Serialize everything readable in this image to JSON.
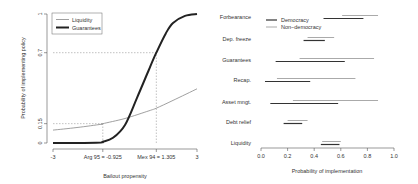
{
  "chart_data": [
    {
      "type": "line",
      "panel": "left",
      "title": "",
      "xlabel": "Bailout propensity",
      "ylabel": "Probability of implementing policy",
      "xlim": [
        -3,
        3
      ],
      "ylim": [
        0,
        1
      ],
      "x_ticks": [
        -3,
        -0.925,
        1.305,
        3
      ],
      "x_tick_labels": [
        "-3",
        "Arg 95 = -0.925",
        "Mex 94 = 1.305",
        "3"
      ],
      "y_ticks": [
        0,
        0.15,
        0.7,
        1
      ],
      "y_tick_labels": [
        "0",
        "0.15",
        "0.7",
        "1"
      ],
      "grid": false,
      "legend": {
        "position": "top-left",
        "entries": [
          {
            "label": "Liquidity",
            "color": "#888888",
            "width": 0.8
          },
          {
            "label": "Guarantees",
            "color": "#222222",
            "width": 2
          }
        ]
      },
      "series": [
        {
          "name": "Liquidity",
          "x": [
            -3,
            -2,
            -1,
            -0.925,
            0,
            1,
            1.305,
            2,
            3
          ],
          "y": [
            0.1,
            0.12,
            0.145,
            0.15,
            0.19,
            0.25,
            0.27,
            0.33,
            0.42
          ]
        },
        {
          "name": "Guarantees",
          "x": [
            -3,
            -2,
            -1,
            -0.925,
            -0.5,
            0,
            0.5,
            1,
            1.305,
            1.7,
            2,
            2.5,
            3
          ],
          "y": [
            0.0,
            0.0,
            0.005,
            0.01,
            0.04,
            0.14,
            0.35,
            0.57,
            0.7,
            0.85,
            0.93,
            0.985,
            1.0
          ]
        }
      ],
      "annotations": [
        {
          "type": "dashed-vline",
          "x": -0.925,
          "y_to": 0.15,
          "label": "Arg 95 = -0.925"
        },
        {
          "type": "dashed-hline",
          "y": 0.15,
          "x_to": -0.925
        },
        {
          "type": "dashed-vline",
          "x": 1.305,
          "y_to": 0.7,
          "label": "Mex 94 = 1.305"
        },
        {
          "type": "dashed-hline",
          "y": 0.7,
          "x_to": 1.305
        }
      ]
    },
    {
      "type": "interval",
      "panel": "right",
      "title": "",
      "xlabel": "Probability of implementation",
      "ylabel": "",
      "xlim": [
        0,
        1
      ],
      "x_ticks": [
        0.0,
        0.2,
        0.4,
        0.6,
        0.8,
        1.0
      ],
      "x_tick_labels": [
        "0.0",
        "0.2",
        "0.4",
        "0.6",
        "0.8",
        "1.0"
      ],
      "grid": false,
      "legend": {
        "position": "top-left",
        "entries": [
          {
            "label": "Democracy",
            "color": "#333333"
          },
          {
            "label": "Non−democracy",
            "color": "#aaaaaa"
          }
        ]
      },
      "categories": [
        "Forbearance",
        "Dep. freeze",
        "Guarantees",
        "Recap.",
        "Asset mngt.",
        "Debt relief",
        "Liquidity"
      ],
      "series": [
        {
          "name": "Democracy",
          "intervals": [
            [
              0.47,
              0.77
            ],
            [
              0.32,
              0.48
            ],
            [
              0.11,
              0.63
            ],
            [
              0.03,
              0.37
            ],
            [
              0.07,
              0.58
            ],
            [
              0.17,
              0.31
            ],
            [
              0.45,
              0.59
            ]
          ]
        },
        {
          "name": "Non−democracy",
          "intervals": [
            [
              0.61,
              0.88
            ],
            [
              0.35,
              0.55
            ],
            [
              0.29,
              0.85
            ],
            [
              0.12,
              0.71
            ],
            [
              0.24,
              0.88
            ],
            [
              0.2,
              0.35
            ],
            [
              0.46,
              0.6
            ]
          ]
        }
      ]
    }
  ]
}
